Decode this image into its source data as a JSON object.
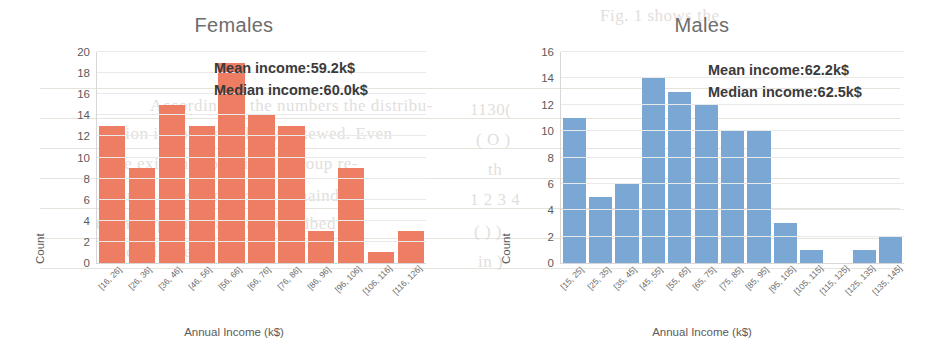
{
  "background_text": {
    "lines": [
      {
        "text": "Fig. 1 shows the",
        "x": 600,
        "y": 6,
        "size": 17
      },
      {
        "text": "According to the numbers the distribu-",
        "x": 150,
        "y": 96,
        "size": 17
      },
      {
        "text": "tion is however always skewed. Even",
        "x": 120,
        "y": 124,
        "size": 17
      },
      {
        "text": "the existence of this sub group re-",
        "x": 110,
        "y": 154,
        "size": 17
      },
      {
        "text": "mains a question for the remainder",
        "x": 100,
        "y": 186,
        "size": 17
      },
      {
        "text": "of the argument and as described",
        "x": 96,
        "y": 214,
        "size": 17
      },
      {
        "text": "below is the ba",
        "x": 104,
        "y": 242,
        "size": 17
      },
      {
        "text": "1130(",
        "x": 470,
        "y": 100,
        "size": 17
      },
      {
        "text": "( O )",
        "x": 476,
        "y": 130,
        "size": 17
      },
      {
        "text": "th",
        "x": 488,
        "y": 160,
        "size": 17
      },
      {
        "text": "1 2 3 4",
        "x": 470,
        "y": 190,
        "size": 17
      },
      {
        "text": "( ) )",
        "x": 474,
        "y": 222,
        "size": 17
      },
      {
        "text": "in )",
        "x": 478,
        "y": 252,
        "size": 17
      }
    ],
    "rules": [
      {
        "x": 40,
        "y": 88,
        "w": 860
      },
      {
        "x": 40,
        "y": 118,
        "w": 860
      },
      {
        "x": 40,
        "y": 148,
        "w": 860
      },
      {
        "x": 40,
        "y": 178,
        "w": 860
      },
      {
        "x": 40,
        "y": 208,
        "w": 860
      },
      {
        "x": 40,
        "y": 238,
        "w": 860
      },
      {
        "x": 40,
        "y": 268,
        "w": 860
      }
    ]
  },
  "colors": {
    "female_bar": "#ed7d63",
    "male_bar": "#7ba7d4",
    "axis": "#d7d7d7",
    "grid": "#e9e9e9",
    "title_text": "#6d6d6d",
    "annotation_text": "#3b3b3b"
  },
  "chart_data": [
    {
      "type": "bar",
      "title": "Females",
      "xlabel": "Annual Income (k$)",
      "ylabel": "Count",
      "ylim": [
        0,
        20
      ],
      "yticks": [
        0,
        2,
        4,
        6,
        8,
        10,
        12,
        14,
        16,
        18,
        20
      ],
      "grid": true,
      "legend": "none",
      "categories": [
        "[16, 26]",
        "[26, 36]",
        "[36, 46]",
        "[46, 56]",
        "[56, 66]",
        "[66, 76]",
        "[76, 86]",
        "[86, 96]",
        "[96, 106]",
        "[106, 116]",
        "[116, 126]"
      ],
      "values": [
        13,
        9,
        15,
        13,
        19,
        14,
        13,
        3,
        9,
        1,
        3
      ],
      "annotations": [
        "Mean income:59.2k$",
        "Median income:60.0k$"
      ],
      "mean_income": "59.2k$",
      "median_income": "60.0k$"
    },
    {
      "type": "bar",
      "title": "Males",
      "xlabel": "Annual Income (k$)",
      "ylabel": "Count",
      "ylim": [
        0,
        16
      ],
      "yticks": [
        0,
        2,
        4,
        6,
        8,
        10,
        12,
        14,
        16
      ],
      "grid": true,
      "legend": "none",
      "categories": [
        "[15, 25]",
        "[25, 35]",
        "[35, 45]",
        "[45, 55]",
        "[55, 65]",
        "[65, 75]",
        "[75, 85]",
        "[85, 95]",
        "[95, 105]",
        "[105, 115]",
        "[115, 125]",
        "[125, 135]",
        "[135, 145]"
      ],
      "values": [
        11,
        5,
        6,
        14,
        13,
        12,
        10,
        10,
        3,
        1,
        0,
        1,
        2
      ],
      "annotations": [
        "Mean income:62.2k$",
        "Median income:62.5k$"
      ],
      "mean_income": "62.2k$",
      "median_income": "62.5k$"
    }
  ]
}
